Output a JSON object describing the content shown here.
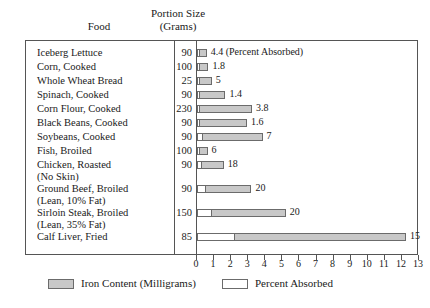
{
  "header": {
    "food_label": "Food",
    "portion_line1": "Portion Size",
    "portion_line2": "(Grams)"
  },
  "legend": {
    "iron_label": "Iron Content (Milligrams)",
    "absorbed_label": "Percent Absorbed"
  },
  "colors": {
    "iron_fill": "#c8c8c8",
    "absorbed_fill": "#ffffff",
    "border": "#6b6b6b",
    "frame": "#555555"
  },
  "chart_data": {
    "type": "bar",
    "title": "",
    "xlabel": "",
    "ylabel": "Food",
    "xlim": [
      0,
      13
    ],
    "grid": false,
    "legend_position": "bottom",
    "orientation": "horizontal",
    "stacked": true,
    "xticks": [
      "0",
      "1",
      "2",
      "3",
      "4",
      "5",
      "6",
      "7",
      "8",
      "9",
      "10",
      "11",
      "12",
      "13"
    ],
    "columns": [
      "Food",
      "Portion Size (Grams)",
      "Percent Absorbed",
      "Iron Content (Milligrams)"
    ],
    "series": [
      {
        "name": "Percent Absorbed",
        "values": [
          0.1,
          0.1,
          0.12,
          0.15,
          0.12,
          0.18,
          0.35,
          0.18,
          0.28,
          0.55,
          0.85,
          2.2
        ]
      },
      {
        "name": "Iron Content (Milligrams)",
        "values": [
          0.45,
          0.55,
          0.75,
          1.55,
          3.1,
          2.8,
          3.55,
          0.5,
          1.35,
          2.7,
          4.4,
          10.1
        ]
      }
    ],
    "categories": [
      "Iceberg Lettuce",
      "Corn, Cooked",
      "Whole Wheat Bread",
      "Spinach, Cooked",
      "Corn Flour, Cooked",
      "Black Beans, Cooked",
      "Soybeans, Cooked",
      "Fish, Broiled",
      "Chicken, Roasted (No Skin)",
      "Ground Beef, Broiled (Lean, 10% Fat)",
      "Sirloin Steak, Broiled (Lean, 35% Fat)",
      "Calf Liver, Fried"
    ],
    "rows": [
      {
        "food_line1": "Iceberg Lettuce",
        "food_line2": "",
        "grams": "90",
        "absorbed": 0.1,
        "iron": 0.45,
        "label": "4.4 (Percent Absorbed)"
      },
      {
        "food_line1": "Corn, Cooked",
        "food_line2": "",
        "grams": "100",
        "absorbed": 0.1,
        "iron": 0.55,
        "label": "1.8"
      },
      {
        "food_line1": "Whole Wheat Bread",
        "food_line2": "",
        "grams": "25",
        "absorbed": 0.12,
        "iron": 0.75,
        "label": "5"
      },
      {
        "food_line1": "Spinach, Cooked",
        "food_line2": "",
        "grams": "90",
        "absorbed": 0.15,
        "iron": 1.55,
        "label": "1.4"
      },
      {
        "food_line1": "Corn Flour, Cooked",
        "food_line2": "",
        "grams": "230",
        "absorbed": 0.12,
        "iron": 3.1,
        "label": "3.8"
      },
      {
        "food_line1": "Black Beans, Cooked",
        "food_line2": "",
        "grams": "90",
        "absorbed": 0.18,
        "iron": 2.8,
        "label": "1.6"
      },
      {
        "food_line1": "Soybeans, Cooked",
        "food_line2": "",
        "grams": "90",
        "absorbed": 0.35,
        "iron": 3.55,
        "label": "7"
      },
      {
        "food_line1": "Fish, Broiled",
        "food_line2": "",
        "grams": "100",
        "absorbed": 0.18,
        "iron": 0.5,
        "label": "6"
      },
      {
        "food_line1": "Chicken, Roasted",
        "food_line2": "(No Skin)",
        "grams": "90",
        "absorbed": 0.28,
        "iron": 1.35,
        "label": "18"
      },
      {
        "food_line1": "Ground Beef, Broiled",
        "food_line2": "(Lean, 10% Fat)",
        "grams": "90",
        "absorbed": 0.55,
        "iron": 2.7,
        "label": "20"
      },
      {
        "food_line1": "Sirloin Steak, Broiled",
        "food_line2": "(Lean, 35% Fat)",
        "grams": "150",
        "absorbed": 0.85,
        "iron": 4.4,
        "label": "20"
      },
      {
        "food_line1": "Calf Liver, Fried",
        "food_line2": "",
        "grams": "85",
        "absorbed": 2.2,
        "iron": 10.1,
        "label": "15"
      }
    ]
  }
}
